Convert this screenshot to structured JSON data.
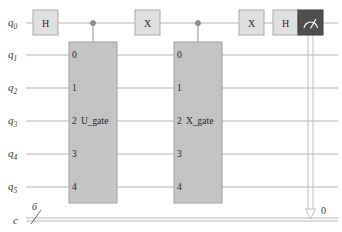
{
  "diagram": {
    "type": "quantum-circuit"
  },
  "registers": {
    "quantum": [
      {
        "name": "q",
        "index": "0",
        "label": "q0"
      },
      {
        "name": "q",
        "index": "1",
        "label": "q1"
      },
      {
        "name": "q",
        "index": "2",
        "label": "q2"
      },
      {
        "name": "q",
        "index": "3",
        "label": "q3"
      },
      {
        "name": "q",
        "index": "4",
        "label": "q4"
      },
      {
        "name": "q",
        "index": "5",
        "label": "q5"
      }
    ],
    "classical": {
      "label": "c",
      "width": "6"
    }
  },
  "gates": {
    "h1": {
      "label": "H",
      "qubit": "q0"
    },
    "x1": {
      "label": "X",
      "qubit": "q0"
    },
    "x2": {
      "label": "X",
      "qubit": "q0"
    },
    "h2": {
      "label": "H",
      "qubit": "q0"
    },
    "measure": {
      "icon": "measure-meter-icon",
      "qubit": "q0",
      "clbit": "0"
    }
  },
  "multi_gates": [
    {
      "name": "U_gate",
      "label": "U_gate",
      "ports": [
        "0",
        "1",
        "2",
        "3",
        "4"
      ],
      "control_qubit": "q0",
      "target_qubits": [
        "q1",
        "q2",
        "q3",
        "q4",
        "q5"
      ]
    },
    {
      "name": "X_gate",
      "label": "X_gate",
      "ports": [
        "0",
        "1",
        "2",
        "3",
        "4"
      ],
      "control_qubit": "q0",
      "target_qubits": [
        "q1",
        "q2",
        "q3",
        "q4",
        "q5"
      ]
    }
  ],
  "measurement": {
    "target_clbit_label": "0"
  },
  "colors": {
    "background": "#ffffff",
    "wire": "#b3b3b3",
    "single_gate_fill": "#e0e0e0",
    "multi_gate_fill": "#c4c4c4",
    "measure_fill": "#4f4f4f",
    "text": "#1f1f1f"
  }
}
